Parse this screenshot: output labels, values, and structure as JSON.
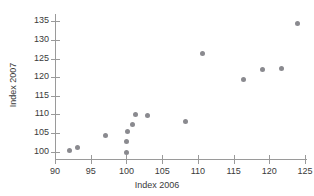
{
  "chart_data": {
    "type": "scatter",
    "title": "",
    "xlabel": "Index 2006",
    "ylabel": "Index 2007",
    "xlim": [
      90,
      125
    ],
    "ylim": [
      98,
      137
    ],
    "xticks": [
      90,
      95,
      100,
      105,
      110,
      115,
      120,
      125
    ],
    "yticks": [
      100,
      105,
      110,
      115,
      120,
      125,
      130,
      135
    ],
    "grid": false,
    "legend": null,
    "marker_color": "#8a8a8f",
    "axis_color": "#9a9a9a",
    "points": [
      {
        "x": 92.0,
        "y": 100.2
      },
      {
        "x": 93.1,
        "y": 101.2
      },
      {
        "x": 97.0,
        "y": 104.2
      },
      {
        "x": 100.0,
        "y": 99.8
      },
      {
        "x": 100.0,
        "y": 102.8
      },
      {
        "x": 100.2,
        "y": 105.4
      },
      {
        "x": 100.8,
        "y": 107.3
      },
      {
        "x": 101.2,
        "y": 109.9
      },
      {
        "x": 103.0,
        "y": 109.6
      },
      {
        "x": 108.3,
        "y": 108.2
      },
      {
        "x": 110.7,
        "y": 126.3
      },
      {
        "x": 116.4,
        "y": 119.4
      },
      {
        "x": 119.1,
        "y": 122.2
      },
      {
        "x": 121.7,
        "y": 122.4
      },
      {
        "x": 124.0,
        "y": 134.5
      }
    ]
  }
}
